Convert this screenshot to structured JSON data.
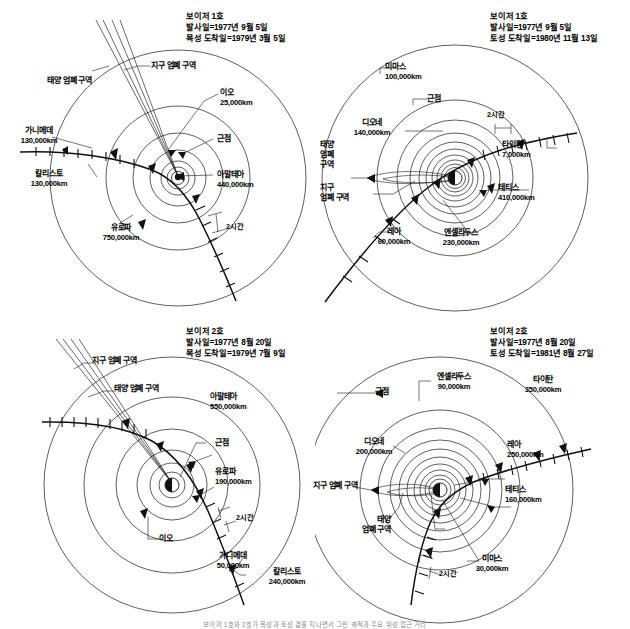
{
  "figure": {
    "caption": "보이저 1호와 2호가 목성과 토성 곁을 지나면서 그린 궤적과 주요 위성 접근 거리"
  },
  "panels": [
    {
      "id": "panel-tl",
      "header": {
        "mission": "보이저 1호",
        "launch": "발사일=1977년 9월 5일",
        "arrival": "목성 도착일=1979년 3월 5일"
      },
      "labels": [
        {
          "name": "태양 엄폐 구역",
          "distance": ""
        },
        {
          "name": "지구 엄폐 구역",
          "distance": ""
        },
        {
          "name": "가니메데",
          "distance": "130,000km"
        },
        {
          "name": "칼리스토",
          "distance": "130,000km"
        },
        {
          "name": "유로파",
          "distance": "750,000km"
        },
        {
          "name": "이오",
          "distance": "25,000km"
        },
        {
          "name": "근점",
          "distance": ""
        },
        {
          "name": "아말테아",
          "distance": "440,000km"
        },
        {
          "name": "2시간",
          "distance": ""
        }
      ]
    },
    {
      "id": "panel-tr",
      "header": {
        "mission": "보이저 1호",
        "launch": "발사일=1977년 9월 5일",
        "arrival": "토성 도착일=1980년 11월 13일"
      },
      "labels": [
        {
          "name": "미마스",
          "distance": "100,000km"
        },
        {
          "name": "근점",
          "distance": ""
        },
        {
          "name": "디오네",
          "distance": "140,000km"
        },
        {
          "name": "태양",
          "distance": ""
        },
        {
          "name": "엄폐",
          "distance": ""
        },
        {
          "name": "구역",
          "distance": ""
        },
        {
          "name": "지구",
          "distance": ""
        },
        {
          "name": "엄폐 구역",
          "distance": ""
        },
        {
          "name": "레아",
          "distance": "60,000km"
        },
        {
          "name": "엔셀라두스",
          "distance": "230,000km"
        },
        {
          "name": "타이탄",
          "distance": "7,000km"
        },
        {
          "name": "테티스",
          "distance": "410,000km"
        },
        {
          "name": "2시간",
          "distance": ""
        }
      ]
    },
    {
      "id": "panel-bl",
      "header": {
        "mission": "보이저 2호",
        "launch": "발사일=1977년 8월 20일",
        "arrival": "목성 도착일=1979년 7월 9일"
      },
      "labels": [
        {
          "name": "지구 엄폐 구역",
          "distance": ""
        },
        {
          "name": "태양 엄폐 구역",
          "distance": ""
        },
        {
          "name": "아말테아",
          "distance": "550,000km"
        },
        {
          "name": "근점",
          "distance": ""
        },
        {
          "name": "유로파",
          "distance": "190,000km"
        },
        {
          "name": "이오",
          "distance": ""
        },
        {
          "name": "가니메데",
          "distance": "50,000km"
        },
        {
          "name": "칼리스토",
          "distance": "240,000km"
        },
        {
          "name": "2시간",
          "distance": ""
        }
      ]
    },
    {
      "id": "panel-br",
      "header": {
        "mission": "보이저 2호",
        "launch": "발사일=1977년 8월 20일",
        "arrival": "토성 도착일=1981년 8월 27일"
      },
      "labels": [
        {
          "name": "근점",
          "distance": ""
        },
        {
          "name": "엔셀라두스",
          "distance": "90,000km"
        },
        {
          "name": "타이탄",
          "distance": "350,000km"
        },
        {
          "name": "디오네",
          "distance": "200,000km"
        },
        {
          "name": "레아",
          "distance": "250,000km"
        },
        {
          "name": "지구 엄폐 구역",
          "distance": ""
        },
        {
          "name": "테티스",
          "distance": "160,000km"
        },
        {
          "name": "태양",
          "distance": ""
        },
        {
          "name": "엄폐 구역",
          "distance": ""
        },
        {
          "name": "미마스",
          "distance": "30,000km"
        },
        {
          "name": "2시간",
          "distance": ""
        }
      ]
    }
  ],
  "panel_tl": {
    "header": {
      "mission": "보이저 1호",
      "launch": "발사일=1977년 9월 5일",
      "arrival": "목성 도착일=1979년 3월 5일"
    },
    "sun_occult": "태양 엄폐 구역",
    "earth_occult": "지구 엄폐 구역",
    "ganymede": "가니메데",
    "ganymede_km": "130,000km",
    "callisto": "칼리스토",
    "callisto_km": "130,000km",
    "europa": "유로파",
    "europa_km": "750,000km",
    "io": "이오",
    "io_km": "25,000km",
    "perijove": "근점",
    "amalthea": "아말테아",
    "amalthea_km": "440,000km",
    "tick": "2시간"
  },
  "panel_tr": {
    "header": {
      "mission": "보이저 1호",
      "launch": "발사일=1977년 9월 5일",
      "arrival": "토성 도착일=1980년 11월 13일"
    },
    "mimas": "미마스",
    "mimas_km": "100,000km",
    "perikrone": "근점",
    "dione": "디오네",
    "dione_km": "140,000km",
    "sun_occult_1": "태양",
    "sun_occult_2": "엄폐",
    "sun_occult_3": "구역",
    "earth_occult_1": "지구",
    "earth_occult_2": "엄폐 구역",
    "rhea": "레아",
    "rhea_km": "60,000km",
    "enceladus": "엔셀라두스",
    "enceladus_km": "230,000km",
    "titan": "타이탄",
    "titan_km": "7,000km",
    "tethys": "테티스",
    "tethys_km": "410,000km",
    "tick": "2시간"
  },
  "panel_bl": {
    "header": {
      "mission": "보이저 2호",
      "launch": "발사일=1977년 8월 20일",
      "arrival": "목성 도착일=1979년 7월 9일"
    },
    "earth_occult": "지구 엄폐 구역",
    "sun_occult": "태양 엄폐 구역",
    "amalthea": "아말테아",
    "amalthea_km": "550,000km",
    "perijove": "근점",
    "europa": "유로파",
    "europa_km": "190,000km",
    "io": "이오",
    "ganymede": "가니메데",
    "ganymede_km": "50,000km",
    "callisto": "칼리스토",
    "callisto_km": "240,000km",
    "tick": "2시간"
  },
  "panel_br": {
    "header": {
      "mission": "보이저 2호",
      "launch": "발사일=1977년 8월 20일",
      "arrival": "토성 도착일=1981년 8월 27일"
    },
    "perikrone": "근점",
    "enceladus": "엔셀라두스",
    "enceladus_km": "90,000km",
    "titan": "타이탄",
    "titan_km": "350,000km",
    "dione": "디오네",
    "dione_km": "200,000km",
    "rhea": "레아",
    "rhea_km": "250,000km",
    "earth_occult": "지구 엄폐 구역",
    "tethys": "테티스",
    "tethys_km": "160,000km",
    "sun_occult_1": "태양",
    "sun_occult_2": "엄폐 구역",
    "mimas": "미마스",
    "mimas_km": "30,000km",
    "tick": "2시간"
  }
}
